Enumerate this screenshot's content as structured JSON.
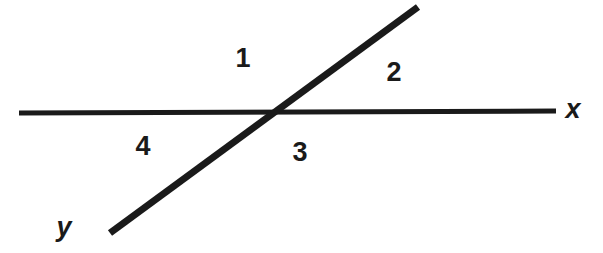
{
  "figure": {
    "background_color": "#ffffff",
    "stroke_color": "#1a1a1a",
    "width": 603,
    "height": 253
  },
  "lines": {
    "horizontal": {
      "name": "line-x",
      "label": "x",
      "x1": 19,
      "y1": 113,
      "x2": 556,
      "y2": 111,
      "thickness": 5
    },
    "diagonal": {
      "name": "line-y",
      "label": "y",
      "x1": 110,
      "y1": 233,
      "x2": 418,
      "y2": 7,
      "thickness": 7
    }
  },
  "intersection": {
    "x": 272,
    "y": 112
  },
  "angles": [
    {
      "id": "1",
      "label": "1",
      "position": "top",
      "x": 243,
      "y": 58
    },
    {
      "id": "2",
      "label": "2",
      "position": "right",
      "x": 394,
      "y": 72
    },
    {
      "id": "3",
      "label": "3",
      "position": "bottom-right",
      "x": 300,
      "y": 152
    },
    {
      "id": "4",
      "label": "4",
      "position": "left",
      "x": 143,
      "y": 146
    }
  ],
  "axis_labels": [
    {
      "id": "x",
      "label": "x",
      "x": 573,
      "y": 109
    },
    {
      "id": "y",
      "label": "y",
      "x": 64,
      "y": 227
    }
  ]
}
